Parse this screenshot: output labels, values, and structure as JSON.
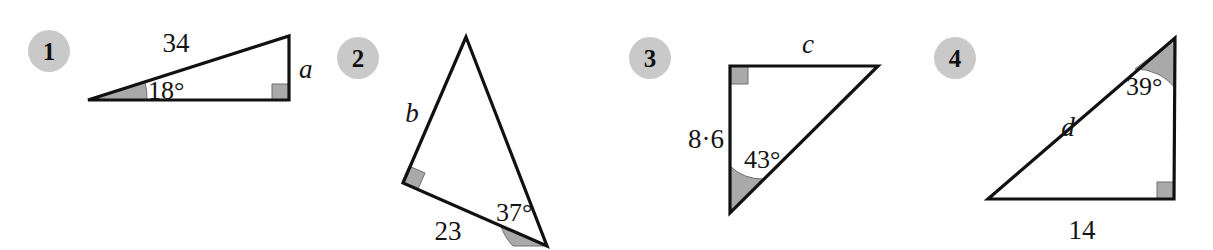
{
  "page": {
    "background_color": "#ffffff",
    "stroke_color": "#111111",
    "shade_color": "#a9a9a9",
    "shade_stroke_color": "#6f6f6f",
    "badge_fill_color": "#c9c9c9",
    "width": 1213,
    "height": 250
  },
  "figures": [
    {
      "id": "figure-1",
      "number": "1",
      "badge": {
        "cx": 49,
        "cy": 51,
        "r": 21
      },
      "type": "right-triangle",
      "points": "88,100 289,36 289,100",
      "right_angle_at": "289,100",
      "right_angle_marker": "272,100 272,84 289,84 289,100",
      "angle_arc": {
        "vertex": "88,100",
        "path": "M 88 100 L 147 100 A 59 59 0 0 0 144.9 81.8 Z",
        "label": "18°",
        "label_x": 148,
        "label_y": 99
      },
      "labels": [
        {
          "name": "hypotenuse-length-label",
          "text": "34",
          "x": 176,
          "y": 52,
          "anchor": "middle",
          "style": "side-label"
        },
        {
          "name": "unknown-side-label-a",
          "text": "a",
          "x": 299,
          "y": 78,
          "anchor": "start",
          "style": "var-label"
        }
      ]
    },
    {
      "id": "figure-2",
      "number": "2",
      "badge": {
        "cx": 358,
        "cy": 58,
        "r": 21
      },
      "type": "right-triangle",
      "points": "466,37 403,183 547,246",
      "right_angle_at": "403,183",
      "right_angle_marker": "409,166 425,173 418,189 402,182",
      "angle_arc": {
        "vertex": "547,246",
        "path": "M 547 246 L 501 226 A 50 50 0 0 0 513 246 Z",
        "label": "37°",
        "label_x": 496,
        "label_y": 221
      },
      "labels": [
        {
          "name": "unknown-side-label-b",
          "text": "b",
          "x": 412,
          "y": 122,
          "anchor": "middle",
          "style": "var-label"
        },
        {
          "name": "base-length-label",
          "text": "23",
          "x": 448,
          "y": 240,
          "anchor": "middle",
          "style": "side-label"
        }
      ]
    },
    {
      "id": "figure-3",
      "number": "3",
      "badge": {
        "cx": 650,
        "cy": 58,
        "r": 21
      },
      "type": "right-triangle",
      "points": "730,66 878,66 730,213",
      "right_angle_at": "730,66",
      "right_angle_marker": "730,66 730,84 748,84 748,66",
      "angle_arc": {
        "vertex": "730,213",
        "path": "M 730 213 L 730 166 A 47 47 0 0 0 763 179 Z",
        "label": "43°",
        "label_x": 744,
        "label_y": 168
      },
      "labels": [
        {
          "name": "unknown-side-label-c",
          "text": "c",
          "x": 808,
          "y": 53,
          "anchor": "middle",
          "style": "var-label"
        },
        {
          "name": "vertical-length-label",
          "text": "8·6",
          "x": 706,
          "y": 148,
          "anchor": "middle",
          "style": "side-label"
        }
      ]
    },
    {
      "id": "figure-4",
      "number": "4",
      "badge": {
        "cx": 955,
        "cy": 58,
        "r": 21
      },
      "type": "right-triangle",
      "points": "1175,38 1174,199 988,199",
      "right_angle_at": "1174,199",
      "right_angle_marker": "1157,199 1157,182 1174,182 1174,199",
      "angle_arc": {
        "vertex": "1175,38",
        "path": "M 1175 38 L 1175 88 A 50 50 0 0 0 1135 69 Z",
        "label": "39°",
        "label_x": 1126,
        "label_y": 95
      },
      "labels": [
        {
          "name": "unknown-side-label-d",
          "text": "d",
          "x": 1068,
          "y": 136,
          "anchor": "middle",
          "style": "var-label"
        },
        {
          "name": "base-length-label",
          "text": "14",
          "x": 1082,
          "y": 239,
          "anchor": "middle",
          "style": "side-label"
        }
      ]
    }
  ]
}
